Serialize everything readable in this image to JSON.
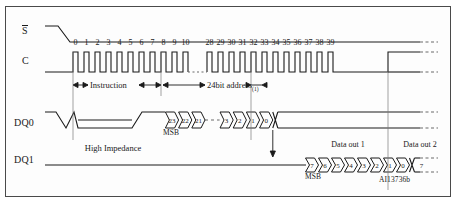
{
  "figure": {
    "id_label": "AI13736b",
    "signals": [
      {
        "name": "S",
        "overline": true,
        "key": "chip_select"
      },
      {
        "name": "C",
        "overline": false,
        "key": "clock"
      },
      {
        "name": "DQ0",
        "overline": false,
        "key": "dq0"
      },
      {
        "name": "DQ1",
        "overline": false,
        "key": "dq1"
      }
    ],
    "clock_cycles": {
      "first_group": [
        "0",
        "1",
        "2",
        "3",
        "4",
        "5",
        "6",
        "7",
        "8",
        "9",
        "10"
      ],
      "second_group": [
        "28",
        "29",
        "30",
        "31",
        "32",
        "33",
        "34",
        "35",
        "36",
        "37",
        "38",
        "39"
      ],
      "break": "..."
    },
    "phases": [
      {
        "label": "Instruction",
        "key": "instruction"
      },
      {
        "label": "24bit address",
        "note": "(1)",
        "key": "address"
      }
    ],
    "dq0": {
      "high_impedance_label": "High Impedance",
      "msb_label": "MSB",
      "address_bits_head": [
        "23",
        "22",
        "21"
      ],
      "address_bits_gap": "- -",
      "address_bits_tail": [
        "3",
        "2",
        "1",
        "0"
      ]
    },
    "dq1": {
      "msb_label": "MSB",
      "data_out_1_label": "Data out 1",
      "data_out_2_label": "Data out 2",
      "data_out_1_bits": [
        "7",
        "6",
        "5",
        "4",
        "3",
        "2",
        "1",
        "0"
      ],
      "data_out_2_bits": [
        "7"
      ]
    },
    "colors": {
      "line": "#1a1a1a",
      "frame": "#4a4a4a",
      "background": "#fdfdfd",
      "dashed": "#6a6a6a"
    }
  }
}
